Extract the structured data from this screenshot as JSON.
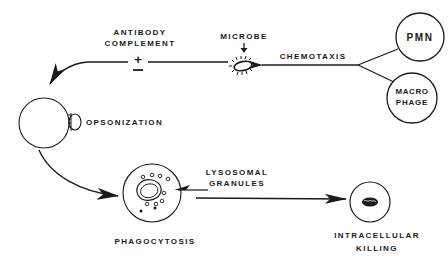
{
  "diagram": {
    "type": "flow",
    "description_nodes": {
      "pmn": {
        "label": "PMN"
      },
      "macrophage": {
        "label_line1": "MACRO",
        "label_line2": "PHAGE"
      },
      "microbe": {
        "label": "MICROBE"
      },
      "chemotaxis": {
        "label": "CHEMOTAXIS"
      },
      "modifiers": {
        "line1": "ANTIBODY",
        "line2": "COMPLEMENT",
        "plus": "+",
        "minus": "−"
      },
      "opsonization": {
        "label": "OPSONIZATION"
      },
      "phagocytosis": {
        "label": "PHAGOCYTOSIS"
      },
      "lysosomal_granules": {
        "line1": "LYSOSOMAL",
        "line2": "GRANULES"
      },
      "intracellular_killing": {
        "line1": "INTRACELLULAR",
        "line2": "KILLING"
      }
    },
    "edges": [
      {
        "from": "PMN",
        "to": "MICROBE",
        "label": "CHEMOTAXIS"
      },
      {
        "from": "MACROPHAGE",
        "to": "MICROBE",
        "label": "CHEMOTAXIS"
      },
      {
        "from": "MICROBE",
        "to": "OPSONIZATION",
        "label": "ANTIBODY / COMPLEMENT (±)"
      },
      {
        "from": "OPSONIZATION",
        "to": "PHAGOCYTOSIS"
      },
      {
        "from": "PHAGOCYTOSIS",
        "to": "INTRACELLULAR KILLING",
        "label": "LYSOSOMAL GRANULES"
      }
    ],
    "colors": {
      "ink": "#1a1a1a",
      "background": "#ffffff"
    }
  }
}
